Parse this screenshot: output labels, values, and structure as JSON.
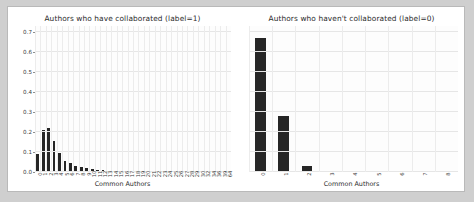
{
  "figure": {
    "background": "#ffffff",
    "page_background": "#cfcfcf",
    "border_color": "#b9b9b9",
    "bar_color": "#262626",
    "grid_color": "#e6e6e6"
  },
  "chart_data": [
    {
      "type": "bar",
      "title": "Authors who have collaborated (label=1)",
      "xlabel": "Common Authors",
      "ylabel": "",
      "ylim": [
        0.0,
        0.73
      ],
      "yticks": [
        "0.0",
        "0.1",
        "0.2",
        "0.3",
        "0.4",
        "0.5",
        "0.6",
        "0.7"
      ],
      "ytick_values": [
        0.0,
        0.1,
        0.2,
        0.3,
        0.4,
        0.5,
        0.6,
        0.7
      ],
      "grid": true,
      "legend": "none",
      "categories": [
        "0",
        "1",
        "2",
        "3",
        "4",
        "5",
        "6",
        "7",
        "8",
        "9",
        "10",
        "11",
        "12",
        "13",
        "14",
        "15",
        "16",
        "17",
        "18",
        "19",
        "20",
        "21",
        "22",
        "23",
        "24",
        "25",
        "26",
        "27",
        "28",
        "29",
        "30",
        "32",
        "34",
        "36",
        "39",
        "64"
      ],
      "values": [
        0.092,
        0.212,
        0.222,
        0.153,
        0.095,
        0.055,
        0.045,
        0.031,
        0.027,
        0.021,
        0.013,
        0.011,
        0.008,
        0.006,
        0.005,
        0.004,
        0.0035,
        0.003,
        0.0025,
        0.002,
        0.002,
        0.0015,
        0.0015,
        0.001,
        0.001,
        0.001,
        0.001,
        0.001,
        0.0008,
        0.0008,
        0.0006,
        0.0006,
        0.0005,
        0.0005,
        0.0004,
        0.0004
      ]
    },
    {
      "type": "bar",
      "title": "Authors who haven't collaborated (label=0)",
      "xlabel": "Common Authors",
      "ylabel": "",
      "ylim": [
        0.0,
        0.73
      ],
      "yticks": [],
      "grid": true,
      "legend": "none",
      "categories": [
        "0",
        "1",
        "2",
        "3",
        "4",
        "5",
        "6",
        "7",
        "8"
      ],
      "values": [
        0.672,
        0.281,
        0.032,
        0.004,
        0.0,
        0.0,
        0.0,
        0.0,
        0.0
      ]
    }
  ]
}
